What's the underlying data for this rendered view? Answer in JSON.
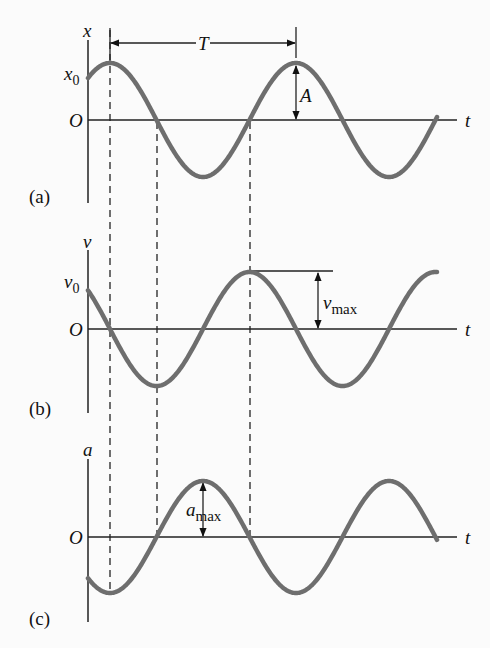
{
  "figure": {
    "panels": [
      {
        "tag": "(a)",
        "y_axis_label": "x",
        "origin_label": "O",
        "t_label": "t",
        "y0_label_main": "x",
        "y0_label_sub": "0",
        "amplitude_label": "A",
        "period_label": "T"
      },
      {
        "tag": "(b)",
        "y_axis_label": "v",
        "origin_label": "O",
        "t_label": "t",
        "y0_label_main": "v",
        "y0_label_sub": "0",
        "amplitude_label_main": "v",
        "amplitude_label_sub": "max"
      },
      {
        "tag": "(c)",
        "y_axis_label": "a",
        "origin_label": "O",
        "t_label": "t",
        "amplitude_label_main": "a",
        "amplitude_label_sub": "max"
      }
    ],
    "colors": {
      "curve": "#6e6e6e",
      "axis": "#222222",
      "background": "#fbfbfb"
    }
  },
  "chart_data": [
    {
      "type": "line",
      "title": "(a) displacement vs time",
      "xlabel": "t",
      "ylabel": "x",
      "function": "x(t) = A cos(ωt − φ)",
      "annotations": [
        "x0 (initial displacement)",
        "A (amplitude)",
        "T (period, peak to peak)"
      ],
      "periods_shown": 1.85,
      "starts_at": "x0 > 0, rising to peak",
      "grid": false
    },
    {
      "type": "line",
      "title": "(b) velocity vs time",
      "xlabel": "t",
      "ylabel": "v",
      "function": "v(t) = −Aω sin(ωt − φ)",
      "annotations": [
        "v0 (initial velocity)",
        "vmax (maximum velocity)"
      ],
      "starts_at": "v0 > 0, falling to zero at x peak",
      "grid": false
    },
    {
      "type": "line",
      "title": "(c) acceleration vs time",
      "xlabel": "t",
      "ylabel": "a",
      "function": "a(t) = −Aω² cos(ωt − φ)",
      "annotations": [
        "amax (maximum acceleration)"
      ],
      "starts_at": "a0 < 0, falling to minimum at x peak",
      "grid": false
    }
  ]
}
